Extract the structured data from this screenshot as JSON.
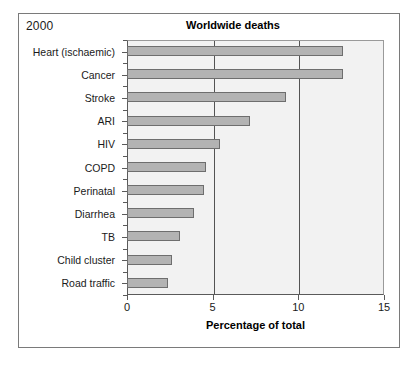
{
  "figure": {
    "year_label": "2000",
    "title": "Worldwide deaths"
  },
  "chart_data": {
    "type": "bar",
    "orientation": "horizontal",
    "title": "Worldwide deaths",
    "xlabel": "Percentage of total",
    "ylabel": "",
    "xlim": [
      0,
      15
    ],
    "xticks": [
      "0",
      "5",
      "10",
      "15"
    ],
    "xtick_values": [
      0,
      5,
      10,
      15
    ],
    "gridlines": [
      5,
      10
    ],
    "grid": true,
    "legend": "none",
    "bar_color": "#b3b3b3",
    "bar_edge_color": "#6e6e6e",
    "plot_background": "#f2f2f2",
    "categories": [
      "Heart (ischaemic)",
      "Cancer",
      "Stroke",
      "ARI",
      "HIV",
      "COPD",
      "Perinatal",
      "Diarrhea",
      "TB",
      "Child cluster",
      "Road traffic"
    ],
    "values": [
      12.6,
      12.6,
      9.3,
      7.2,
      5.4,
      4.6,
      4.5,
      3.9,
      3.1,
      2.6,
      2.4
    ]
  }
}
